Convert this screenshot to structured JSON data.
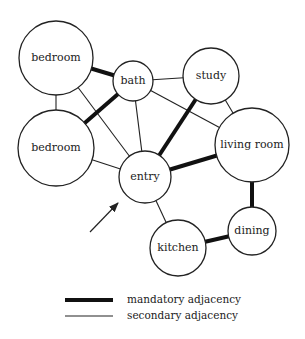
{
  "diagram": {
    "rooms": [
      {
        "id": "bedroom1",
        "label": "bedroom",
        "cx": 56,
        "cy": 58,
        "r": 37
      },
      {
        "id": "bedroom2",
        "label": "bedroom",
        "cx": 56,
        "cy": 148,
        "r": 38
      },
      {
        "id": "bath",
        "label": "bath",
        "cx": 133,
        "cy": 81,
        "r": 20
      },
      {
        "id": "study",
        "label": "study",
        "cx": 211,
        "cy": 76,
        "r": 28
      },
      {
        "id": "living",
        "label": "living room",
        "cx": 252,
        "cy": 145,
        "r": 37
      },
      {
        "id": "entry",
        "label": "entry",
        "cx": 145,
        "cy": 177,
        "r": 26
      },
      {
        "id": "dining",
        "label": "dining",
        "cx": 252,
        "cy": 231,
        "r": 24
      },
      {
        "id": "kitchen",
        "label": "kitchen",
        "cx": 178,
        "cy": 248,
        "r": 28
      }
    ],
    "edges": [
      {
        "from": "bedroom1",
        "to": "bath",
        "type": "mandatory"
      },
      {
        "from": "bedroom1",
        "to": "bedroom2",
        "type": "secondary"
      },
      {
        "from": "bedroom1",
        "to": "entry",
        "type": "secondary"
      },
      {
        "from": "bedroom2",
        "to": "bath",
        "type": "mandatory"
      },
      {
        "from": "bedroom2",
        "to": "entry",
        "type": "secondary"
      },
      {
        "from": "bath",
        "to": "study",
        "type": "secondary"
      },
      {
        "from": "bath",
        "to": "entry",
        "type": "secondary"
      },
      {
        "from": "bath",
        "to": "living",
        "type": "secondary"
      },
      {
        "from": "study",
        "to": "entry",
        "type": "mandatory"
      },
      {
        "from": "study",
        "to": "living",
        "type": "secondary"
      },
      {
        "from": "entry",
        "to": "living",
        "type": "mandatory"
      },
      {
        "from": "entry",
        "to": "kitchen",
        "type": "secondary"
      },
      {
        "from": "living",
        "to": "dining",
        "type": "mandatory"
      },
      {
        "from": "dining",
        "to": "kitchen",
        "type": "mandatory"
      }
    ],
    "entry_arrow": {
      "x1": 90,
      "y1": 232,
      "x2": 118,
      "y2": 203
    }
  },
  "legend": {
    "mandatory_label": "mandatory adjacency",
    "secondary_label": "secondary adjacency"
  }
}
